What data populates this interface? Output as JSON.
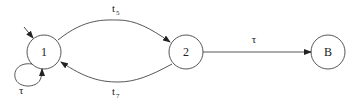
{
  "diagram": {
    "type": "state-transition",
    "nodes": [
      {
        "id": "1",
        "label": "1",
        "cx": 44,
        "cy": 52,
        "r": 17,
        "initial": true
      },
      {
        "id": "2",
        "label": "2",
        "cx": 186,
        "cy": 52,
        "r": 17
      },
      {
        "id": "B",
        "label": "B",
        "cx": 328,
        "cy": 52,
        "r": 17
      }
    ],
    "edges": [
      {
        "from": "1",
        "to": "2",
        "label": "t",
        "subscript": "5",
        "style": "arc-up"
      },
      {
        "from": "2",
        "to": "1",
        "label": "t",
        "subscript": "7",
        "style": "arc-down"
      },
      {
        "from": "2",
        "to": "B",
        "label": "τ",
        "style": "straight"
      },
      {
        "from": "1",
        "to": "1",
        "label": "τ",
        "style": "self-loop"
      }
    ]
  }
}
